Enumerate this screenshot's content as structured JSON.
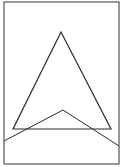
{
  "diagram": {
    "width": 126,
    "height": 167,
    "background": "#ffffff",
    "stroke_color": "#2a2a2a",
    "frame": {
      "x": 4,
      "y": 2,
      "width": 115,
      "height": 162,
      "stroke": "#555555"
    },
    "triangle": {
      "points": [
        [
          61,
          32
        ],
        [
          13,
          129
        ],
        [
          111,
          129
        ]
      ]
    },
    "polyline": {
      "points": [
        [
          4,
          141
        ],
        [
          63,
          110
        ],
        [
          119,
          146
        ]
      ]
    }
  }
}
